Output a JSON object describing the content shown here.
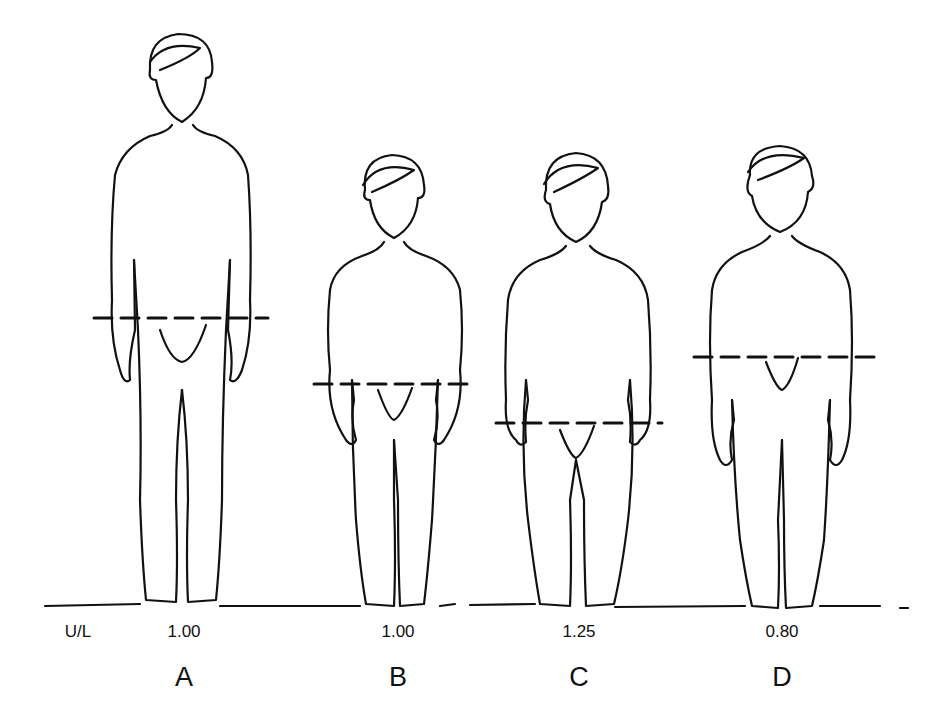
{
  "figure": {
    "ratio_label": "U/L",
    "figures": [
      {
        "letter": "A",
        "ratio": "1.00",
        "cx": 182,
        "midline_y": 318
      },
      {
        "letter": "B",
        "ratio": "1.00",
        "cx": 394,
        "midline_y": 384
      },
      {
        "letter": "C",
        "ratio": "1.25",
        "cx": 576,
        "midline_y": 423
      },
      {
        "letter": "D",
        "ratio": "0.80",
        "cx": 782,
        "midline_y": 357
      }
    ]
  }
}
